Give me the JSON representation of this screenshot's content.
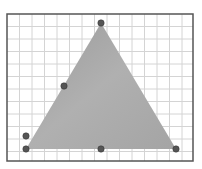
{
  "diagram": {
    "frame": {
      "x": 7,
      "y": 14,
      "w": 186,
      "h": 147,
      "stroke": "#555555"
    },
    "grid": {
      "spacing": 12.5,
      "color": "#d4d4d4"
    },
    "triangle": {
      "vertices": [
        [
          26,
          149
        ],
        [
          101,
          23
        ],
        [
          176,
          149
        ]
      ],
      "fill": "#a9a9a9"
    },
    "points": [
      {
        "name": "apex",
        "x": 101,
        "y": 23
      },
      {
        "name": "left-side-mid",
        "x": 64,
        "y": 86
      },
      {
        "name": "left-lower",
        "x": 26,
        "y": 136
      },
      {
        "name": "bottom-left",
        "x": 26,
        "y": 149
      },
      {
        "name": "bottom-mid",
        "x": 101,
        "y": 149
      },
      {
        "name": "bottom-right",
        "x": 176,
        "y": 149
      }
    ],
    "point_color": "#555555"
  }
}
